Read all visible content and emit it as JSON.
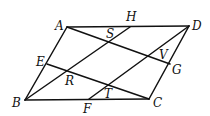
{
  "diagram": {
    "points": {
      "A": {
        "x": 67,
        "y": 27,
        "lx": 55,
        "ly": 30
      },
      "H": {
        "x": 130,
        "y": 27,
        "lx": 126,
        "ly": 21
      },
      "D": {
        "x": 189,
        "y": 26,
        "lx": 192,
        "ly": 30
      },
      "E": {
        "x": 47,
        "y": 64,
        "lx": 36,
        "ly": 66
      },
      "G": {
        "x": 170,
        "y": 64,
        "lx": 172,
        "ly": 74
      },
      "B": {
        "x": 25,
        "y": 100,
        "lx": 12,
        "ly": 107
      },
      "F": {
        "x": 89,
        "y": 99,
        "lx": 83,
        "ly": 113
      },
      "C": {
        "x": 149,
        "y": 99,
        "lx": 153,
        "ly": 107
      },
      "S": {
        "x": 110,
        "y": 40,
        "lx": 106,
        "ly": 38
      },
      "V": {
        "x": 155,
        "y": 57,
        "lx": 159,
        "ly": 59
      },
      "R": {
        "x": 69,
        "y": 72,
        "lx": 65,
        "ly": 85
      },
      "T": {
        "x": 108,
        "y": 85,
        "lx": 104,
        "ly": 98
      }
    },
    "labels": [
      "A",
      "H",
      "D",
      "E",
      "G",
      "B",
      "F",
      "C",
      "S",
      "V",
      "R",
      "T"
    ],
    "segments": [
      [
        "A",
        "D"
      ],
      [
        "D",
        "C"
      ],
      [
        "C",
        "B"
      ],
      [
        "B",
        "A"
      ],
      [
        "A",
        "G"
      ],
      [
        "E",
        "C"
      ],
      [
        "B",
        "H"
      ],
      [
        "F",
        "D"
      ]
    ],
    "colors": {
      "stroke": "#111111",
      "background": "#ffffff"
    }
  }
}
